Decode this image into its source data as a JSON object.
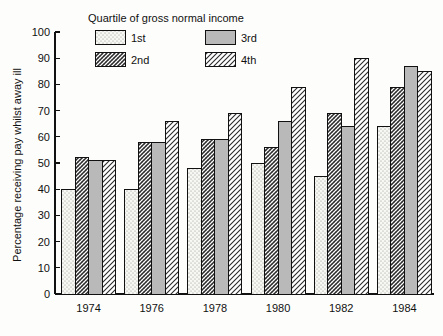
{
  "chart_data": {
    "type": "bar",
    "title": "",
    "legend_title": "Quartile of gross normal income",
    "legend_position": "top-left-inside",
    "xlabel": "",
    "ylabel": "Percentage receiving pay whilst away ill",
    "ylim": [
      0,
      100
    ],
    "yticks": [
      0,
      10,
      20,
      30,
      40,
      50,
      60,
      70,
      80,
      90,
      100
    ],
    "ytick_labels": [
      "0",
      "10",
      "20",
      "30",
      "40",
      "50",
      "60",
      "70",
      "80",
      "90",
      "100"
    ],
    "grid": false,
    "categories": [
      "1974",
      "1976",
      "1978",
      "1980",
      "1982",
      "1984"
    ],
    "series": [
      {
        "name": "1st",
        "pattern": "dotted",
        "values": [
          40,
          40,
          48,
          50,
          45,
          64
        ]
      },
      {
        "name": "2nd",
        "pattern": "cross-hatch",
        "values": [
          52,
          58,
          59,
          56,
          69,
          79
        ]
      },
      {
        "name": "3rd",
        "pattern": "solid-gray",
        "values": [
          51,
          58,
          59,
          66,
          64,
          87
        ]
      },
      {
        "name": "4th",
        "pattern": "diagonal",
        "values": [
          51,
          66,
          69,
          79,
          90,
          85
        ]
      }
    ]
  },
  "colors": {
    "background": "#fdfdfb",
    "axis": "#111111",
    "bar_outline": "#111111",
    "solid_gray_fill": "#b8b8b8",
    "dotted_fill": "#f6f6f2",
    "hatch_fill": "#ffffff"
  },
  "legend": {
    "title": "Quartile of gross normal income",
    "entries": [
      {
        "label": "1st",
        "pattern": "dotted"
      },
      {
        "label": "3rd",
        "pattern": "solid-gray"
      },
      {
        "label": "2nd",
        "pattern": "cross-hatch"
      },
      {
        "label": "4th",
        "pattern": "diagonal"
      }
    ]
  },
  "axes": {
    "y_title": "Percentage receiving pay whilst away ill",
    "y_max_label": "100",
    "y_min_label": "0"
  }
}
